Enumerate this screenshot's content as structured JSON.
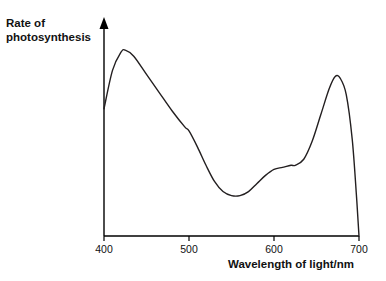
{
  "chart_data": {
    "type": "line",
    "title": "",
    "xlabel": "Wavelength of light/nm",
    "ylabel": "Rate of photosynthesis",
    "xlim": [
      400,
      700
    ],
    "ylim": [
      0,
      100
    ],
    "xticks": [
      400,
      500,
      600,
      700
    ],
    "xtick_labels": [
      "400",
      "500",
      "600",
      "700"
    ],
    "yticks": [],
    "ytick_labels": [],
    "grid": false,
    "legend": false,
    "axis_color": "#000000",
    "line_color": "#231f20",
    "background": "#ffffff",
    "series": [
      {
        "name": "Rate of photosynthesis",
        "x": [
          400,
          410,
          420,
          425,
          435,
          450,
          465,
          480,
          495,
          500,
          510,
          520,
          530,
          540,
          550,
          560,
          570,
          580,
          590,
          600,
          610,
          620,
          625,
          635,
          645,
          655,
          665,
          672,
          678,
          685,
          692,
          697,
          700
        ],
        "values": [
          63,
          82,
          91,
          92,
          89,
          80,
          71,
          62,
          54,
          52,
          44,
          35,
          27,
          22,
          20,
          20,
          22,
          26,
          30,
          33,
          34,
          35,
          35,
          38,
          47,
          60,
          73,
          79,
          78,
          70,
          48,
          20,
          0
        ]
      }
    ]
  },
  "labels": {
    "y_axis_line1": "Rate of",
    "y_axis_line2": "photosynthesis",
    "x_axis": "Wavelength of light/nm"
  }
}
